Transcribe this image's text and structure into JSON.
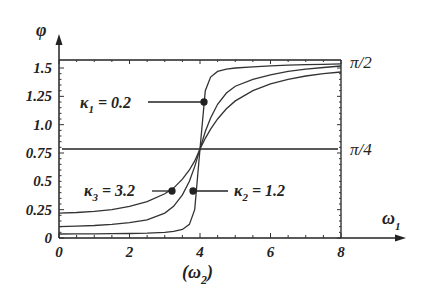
{
  "chart_data": {
    "type": "line",
    "title": "",
    "xlabel": "ω1",
    "xlabel_sub": "(ω2)",
    "ylabel": "φ",
    "xlim": [
      0,
      8
    ],
    "ylim": [
      0,
      1.5708
    ],
    "x_ticks": [
      "0",
      "2",
      "4",
      "6",
      "8"
    ],
    "y_ticks": [
      "0",
      "0.25",
      "0.5",
      "0.75",
      "1.0",
      "1.25",
      "1.5"
    ],
    "right_labels": [
      {
        "text": "π/2",
        "value": 1.5708
      },
      {
        "text": "π/4",
        "value": 0.7854
      }
    ],
    "reference_line": {
      "y": 0.7854,
      "label": "π/4"
    },
    "x": [
      0,
      0.5,
      1,
      1.5,
      2,
      2.5,
      3,
      3.25,
      3.5,
      3.7,
      3.85,
      4,
      4.15,
      4.3,
      4.5,
      4.75,
      5,
      5.5,
      6,
      6.5,
      7,
      7.5,
      8
    ],
    "series": [
      {
        "name": "κ1 = 0.2",
        "kappa": 0.2,
        "values": [
          0.035,
          0.036,
          0.037,
          0.038,
          0.04,
          0.043,
          0.05,
          0.058,
          0.075,
          0.12,
          0.25,
          0.785,
          1.3,
          1.42,
          1.47,
          1.49,
          1.5,
          1.51,
          1.52,
          1.525,
          1.53,
          1.533,
          1.536
        ]
      },
      {
        "name": "κ2 = 1.2",
        "kappa": 1.2,
        "values": [
          0.1,
          0.105,
          0.11,
          0.12,
          0.135,
          0.16,
          0.22,
          0.28,
          0.38,
          0.5,
          0.63,
          0.785,
          0.94,
          1.06,
          1.18,
          1.28,
          1.34,
          1.4,
          1.44,
          1.47,
          1.49,
          1.505,
          1.518
        ]
      },
      {
        "name": "κ3 = 3.2",
        "kappa": 3.2,
        "values": [
          0.22,
          0.225,
          0.235,
          0.25,
          0.28,
          0.32,
          0.39,
          0.44,
          0.52,
          0.6,
          0.68,
          0.785,
          0.88,
          0.96,
          1.05,
          1.14,
          1.21,
          1.3,
          1.36,
          1.4,
          1.43,
          1.45,
          1.465
        ]
      }
    ],
    "annotations": [
      {
        "text": "κ1 = 0.2",
        "points_to": {
          "x": 4.1,
          "y": 1.22
        }
      },
      {
        "text": "κ3 = 3.2",
        "points_to": {
          "x": 3.2,
          "y": 0.415
        }
      },
      {
        "text": "κ2 = 1.2",
        "points_to": {
          "x": 3.78,
          "y": 0.415
        }
      }
    ],
    "grid": false,
    "legend": "none"
  },
  "labels": {
    "phi": "φ",
    "omega1": "ω",
    "omega1_sub": "1",
    "omega2_open": "(ω",
    "omega2_sub": "2",
    "omega2_close": ")",
    "pi2": "π/2",
    "pi4": "π/4",
    "k1_main": "κ",
    "k1_sub": "1",
    "k1_val": " = 0.2",
    "k2_main": "κ",
    "k2_sub": "2",
    "k2_val": " = 1.2",
    "k3_main": "κ",
    "k3_sub": "3",
    "k3_val": " = 3.2"
  }
}
